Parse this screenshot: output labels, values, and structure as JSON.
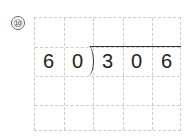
{
  "problem": {
    "number": "⑩",
    "divisor": [
      "6",
      "0"
    ],
    "dividend": [
      "3",
      "0",
      "6"
    ],
    "grid": {
      "columns": 5,
      "rows": 4
    }
  }
}
